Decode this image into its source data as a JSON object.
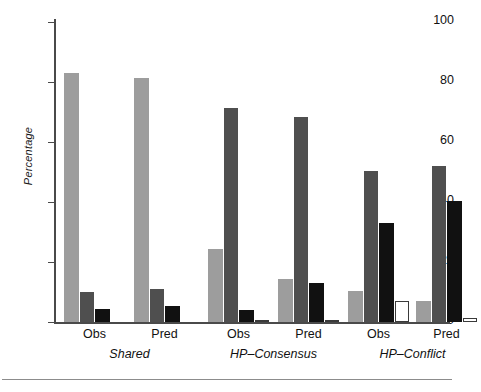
{
  "chart_data": {
    "type": "bar",
    "title": "",
    "subtitle": "",
    "xlabel": "",
    "ylabel": "Percentage",
    "ylim": [
      0,
      100
    ],
    "yticks": [
      0,
      20,
      40,
      60,
      80,
      100
    ],
    "ytick_labels": [
      "0",
      "20",
      "40",
      "60",
      "80",
      "100"
    ],
    "grid": false,
    "legend_position": "none",
    "categories": [
      "Obs",
      "Pred",
      "Obs",
      "Pred",
      "Obs",
      "Pred"
    ],
    "group_labels": [
      "Shared",
      "HP–Consensus",
      "HP–Conflict"
    ],
    "series": [
      {
        "name": "series-1",
        "color": "#9d9d9d",
        "values": [
          83,
          81.5,
          24.5,
          14.5,
          10.5,
          7
        ]
      },
      {
        "name": "series-2",
        "color": "#4f4f4f",
        "values": [
          10,
          11,
          71.5,
          68.5,
          50.5,
          52
        ]
      },
      {
        "name": "series-3",
        "color": "#111111",
        "values": [
          4.5,
          5.5,
          4,
          13,
          33,
          40.5
        ]
      },
      {
        "name": "series-4",
        "color": "#ffffff",
        "values": [
          0,
          0,
          0.7,
          0.8,
          7,
          1.2
        ]
      }
    ]
  },
  "axis": {
    "y_label": "Percentage"
  }
}
